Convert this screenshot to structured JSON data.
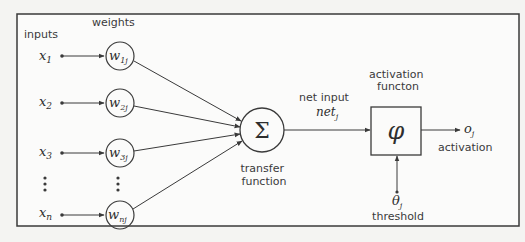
{
  "diagram": {
    "labels": {
      "inputs": "inputs",
      "weights": "weights",
      "net_input": "net input",
      "net_symbol": "net",
      "net_sub": "j",
      "transfer_line1": "transfer",
      "transfer_line2": "function",
      "activation_fn_line1": "activation",
      "activation_fn_line2": "functon",
      "output_symbol": "o",
      "output_sub": "j",
      "output_label": "activation",
      "threshold_symbol": "θ",
      "threshold_sub": "j",
      "threshold_label": "threshold",
      "sum_symbol": "Σ",
      "phi_symbol": "φ",
      "ellipsis": "⋮"
    },
    "inputs": [
      {
        "symbol": "x",
        "sub": "1",
        "weight": "w",
        "weight_sub": "1j"
      },
      {
        "symbol": "x",
        "sub": "2",
        "weight": "w",
        "weight_sub": "2j"
      },
      {
        "symbol": "x",
        "sub": "3",
        "weight": "w",
        "weight_sub": "3j"
      },
      {
        "symbol": "x",
        "sub": "n",
        "weight": "w",
        "weight_sub": "nj"
      }
    ],
    "colors": {
      "line": "#3a3a3a",
      "background": "#f4f4f2",
      "panel": "#fbfbfa"
    }
  }
}
